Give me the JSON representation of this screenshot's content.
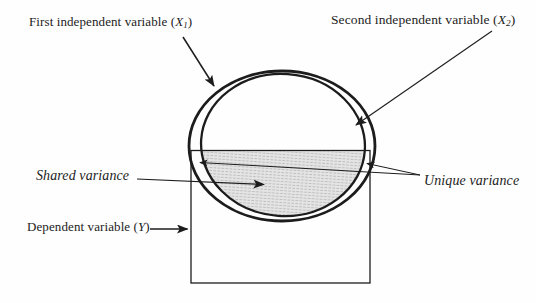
{
  "figure": {
    "colors": {
      "ink": "#1c1c1c",
      "paper": "#fefefe",
      "shading_fill": "#e4e4e4",
      "shading_stripe": "#bdbdbd"
    }
  },
  "labels": {
    "x1": {
      "prefix": "First independent variable (",
      "symbol": "X",
      "subscript": "1",
      "suffix": ")"
    },
    "x2": {
      "prefix": "Second independent variable (",
      "symbol": "X",
      "subscript": "2",
      "suffix": ")"
    },
    "shared_variance": {
      "text": "Shared variance"
    },
    "unique_variance": {
      "text": "Unique variance"
    },
    "dependent": {
      "prefix": "Dependent variable (",
      "symbol": "Y",
      "suffix": ")"
    }
  },
  "diagram": {
    "shapes": [
      {
        "name": "first-independent-variable-circle",
        "type": "ellipse",
        "points_to": "outer circle"
      },
      {
        "name": "second-independent-variable-circle",
        "type": "ellipse",
        "points_to": "inner circle"
      },
      {
        "name": "dependent-variable-rectangle",
        "type": "rectangle"
      },
      {
        "name": "shared-variance-region",
        "type": "shaded overlap of circles and rectangle"
      },
      {
        "name": "unique-variance-regions",
        "type": "crescent gaps between the two circles (two arrows)"
      }
    ]
  }
}
